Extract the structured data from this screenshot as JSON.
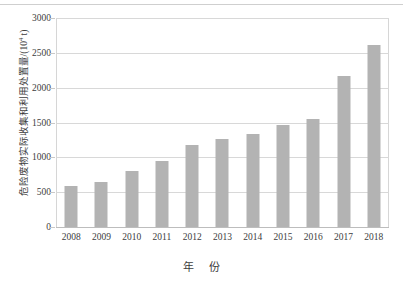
{
  "chart_data": {
    "type": "bar",
    "title": "",
    "xlabel": "年  份",
    "ylabel": "危险废物实际收集和利用处置量/(10⁴ t)",
    "ylabel_text": "危险废物实际收集和利用处置量/(10",
    "ylabel_sup": "4",
    "ylabel_tail": " t)",
    "categories": [
      "2008",
      "2009",
      "2010",
      "2011",
      "2012",
      "2013",
      "2014",
      "2015",
      "2016",
      "2017",
      "2018"
    ],
    "values": [
      590,
      640,
      800,
      945,
      1180,
      1260,
      1330,
      1460,
      1550,
      2170,
      2620
    ],
    "ylim": [
      0,
      3000
    ],
    "yticks": [
      0,
      500,
      1000,
      1500,
      2000,
      2500,
      3000
    ],
    "ytick_labels": [
      "0",
      "500",
      "1000",
      "1500",
      "2000",
      "2500",
      "3000"
    ],
    "grid": true,
    "legend": false,
    "legend_position": "none",
    "bar_color": "#b3b3b3",
    "grid_color": "#d8d8d8",
    "axis_color": "#c9c9c9",
    "text_color": "#3d3d3d",
    "background": "#ffffff"
  }
}
